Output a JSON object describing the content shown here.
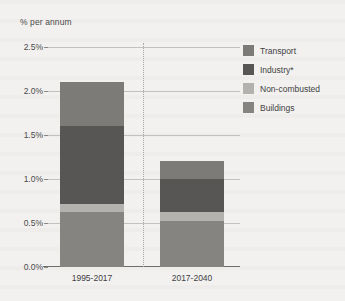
{
  "chart_data": {
    "type": "bar",
    "title": "",
    "subtitle": "",
    "xlabel": "",
    "ylabel": "% per annum",
    "categories": [
      "1995-2017",
      "2017-2040"
    ],
    "stacked": true,
    "ylim": [
      0,
      2.5
    ],
    "yticks": [
      0.0,
      0.5,
      1.0,
      1.5,
      2.0,
      2.5
    ],
    "ytick_labels": [
      "0.0%",
      "0.5%",
      "1.0%",
      "1.5%",
      "2.0%",
      "2.5%"
    ],
    "grid": true,
    "legend_position": "right",
    "series": [
      {
        "name": "Transport",
        "color": "#7d7b78",
        "values": [
          0.5,
          0.2
        ]
      },
      {
        "name": "Industry*",
        "color": "#575654",
        "values": [
          0.88,
          0.38
        ]
      },
      {
        "name": "Non-combusted",
        "color": "#b4b2ae",
        "values": [
          0.1,
          0.1
        ]
      },
      {
        "name": "Buildings",
        "color": "#868481",
        "values": [
          0.62,
          0.52
        ]
      }
    ],
    "stack_order_bottom_to_top": [
      "Buildings",
      "Non-combusted",
      "Industry*",
      "Transport"
    ],
    "totals": [
      2.1,
      1.2
    ],
    "annotations": {
      "divider_between_categories": true
    }
  },
  "colors": {
    "background": "#f2f1ef",
    "gridline": "#c3c1bd",
    "axis": "#6f6d6a",
    "text": "#3f3f3f"
  }
}
